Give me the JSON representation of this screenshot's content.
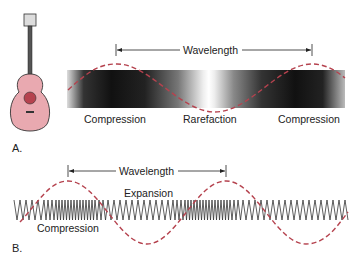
{
  "panel_a": {
    "label": "A.",
    "wavelength_label": "Wavelength",
    "labels": [
      "Compression",
      "Rarefaction",
      "Compression"
    ]
  },
  "panel_b": {
    "label": "B.",
    "wavelength_label": "Wavelength",
    "expansion_label": "Expansion",
    "compression_label": "Compression"
  },
  "colors": {
    "wave": "#b5424e",
    "guitar_body": "#e9a9b0",
    "outline": "#333333"
  }
}
